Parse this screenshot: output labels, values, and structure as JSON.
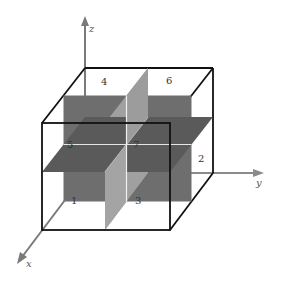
{
  "figure": {
    "type": "3D octant diagram",
    "axes": {
      "x_label": "x",
      "y_label": "y",
      "z_label": "z"
    },
    "octant_labels": {
      "o1": "1",
      "o2": "2",
      "o3": "3",
      "o4": "4",
      "o5": "5",
      "o6": "6",
      "o7": "7"
    },
    "colors": {
      "dark_plane": "#6b6b6b",
      "mid_plane": "#5c5c5c",
      "light_plane": "#9a9a9a",
      "box_edge": "#111111",
      "axis": "#7a7a7a",
      "background": "#ffffff"
    },
    "caption": ""
  }
}
